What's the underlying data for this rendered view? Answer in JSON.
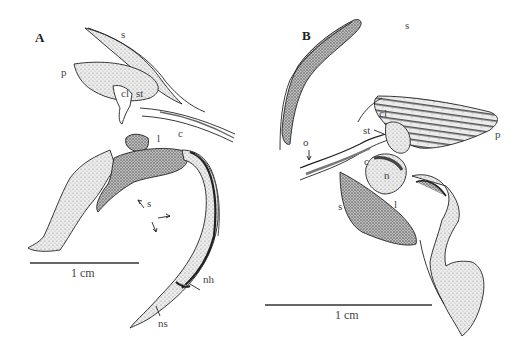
{
  "figure": {
    "panels": [
      {
        "id": "A",
        "letter": "A",
        "labels": {
          "s_top": "s",
          "p": "p",
          "cl": "cl",
          "st": "st",
          "l": "l",
          "c": "c",
          "s_arrows": "s",
          "nh": "nh",
          "ns": "ns"
        },
        "scale_bar": {
          "text": "1 cm"
        }
      },
      {
        "id": "B",
        "letter": "B",
        "labels": {
          "s_top": "s",
          "cl": "cl",
          "st": "st",
          "p": "p",
          "o": "o",
          "c": "c",
          "n": "n",
          "s_lower": "s",
          "l": "l"
        },
        "scale_bar": {
          "text": "1 cm"
        }
      }
    ],
    "colors": {
      "ink": "#222222",
      "stipple_light": "#d9d9d9",
      "stipple_mid": "#b5b5b5",
      "stipple_dark": "#6e6e6e",
      "label": "#444444"
    }
  }
}
